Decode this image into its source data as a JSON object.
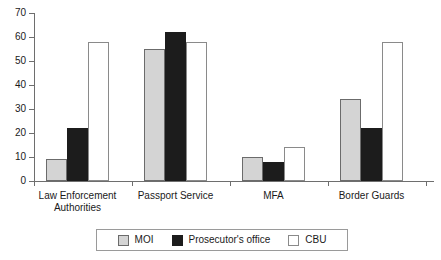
{
  "chart_data": {
    "type": "bar",
    "title": "",
    "subtitle": "",
    "xlabel": "",
    "ylabel": "",
    "ylim": [
      0,
      70
    ],
    "ytick_step": 10,
    "yticks": [
      0,
      10,
      20,
      30,
      40,
      50,
      60,
      70
    ],
    "ytick_labels": [
      "0",
      "10",
      "20",
      "30",
      "40",
      "50",
      "60",
      "70"
    ],
    "grid": false,
    "legend_position": "bottom",
    "categories": [
      "Law Enforcement\nAuthorities",
      "Passport Service",
      "MFA",
      "Border Guards"
    ],
    "series": [
      {
        "name": "MOI",
        "color": "#d4d4d4",
        "edge_color": "#6b6b6b",
        "values": [
          9,
          55,
          10,
          34
        ]
      },
      {
        "name": "Prosecutor's office",
        "color": "#1c1c1c",
        "edge_color": "#1c1c1c",
        "values": [
          22,
          62,
          8,
          22
        ]
      },
      {
        "name": "CBU",
        "color": "#ffffff",
        "edge_color": "#8a8a8a",
        "values": [
          58,
          58,
          14,
          58
        ]
      }
    ]
  },
  "legend": {
    "items": [
      {
        "label": "MOI"
      },
      {
        "label": "Prosecutor's office"
      },
      {
        "label": "CBU"
      }
    ]
  },
  "axis": {
    "line_color": "#6e6e6e"
  }
}
